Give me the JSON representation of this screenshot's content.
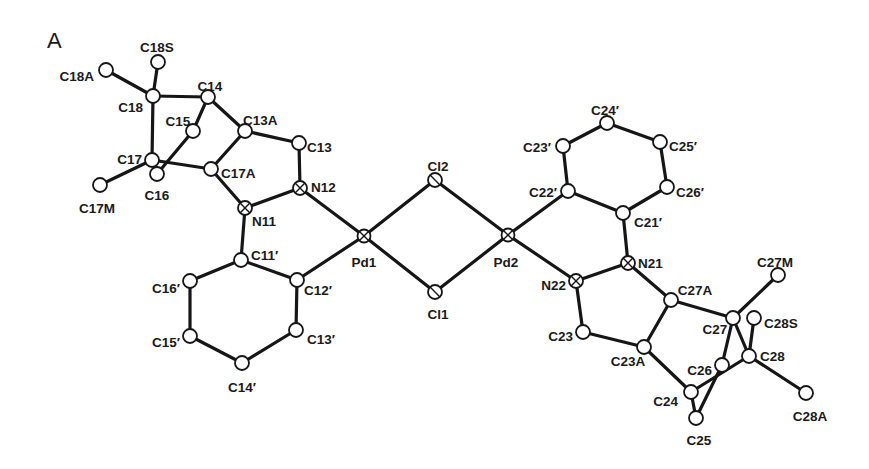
{
  "figure": {
    "panel_label": "A",
    "type": "ORTEP molecular structure drawing",
    "background": "#ffffff",
    "ink_color": "#161616"
  },
  "atoms": [
    {
      "id": "C18S",
      "x": 158,
      "y": 62,
      "label": "C18S",
      "lx": 157,
      "ly": 48,
      "anchor": "middle",
      "kind": "C"
    },
    {
      "id": "C18A",
      "x": 106,
      "y": 70,
      "label": "C18A",
      "lx": 94,
      "ly": 77,
      "anchor": "end",
      "kind": "C"
    },
    {
      "id": "C18",
      "x": 153,
      "y": 96,
      "label": "C18",
      "lx": 143,
      "ly": 108,
      "anchor": "end",
      "kind": "C"
    },
    {
      "id": "C14",
      "x": 208,
      "y": 97,
      "label": "C14",
      "lx": 210,
      "ly": 87,
      "anchor": "middle",
      "kind": "C"
    },
    {
      "id": "C15",
      "x": 193,
      "y": 131,
      "label": "C15",
      "lx": 178,
      "ly": 122,
      "anchor": "middle",
      "kind": "C"
    },
    {
      "id": "C13A",
      "x": 245,
      "y": 131,
      "label": "C13A",
      "lx": 243,
      "ly": 121,
      "anchor": "start",
      "kind": "C"
    },
    {
      "id": "C17",
      "x": 152,
      "y": 160,
      "label": "C17",
      "lx": 142,
      "ly": 160,
      "anchor": "end",
      "kind": "C"
    },
    {
      "id": "C16",
      "x": 157,
      "y": 174,
      "label": "C16",
      "lx": 157,
      "ly": 196,
      "anchor": "middle",
      "kind": "C"
    },
    {
      "id": "C17A",
      "x": 211,
      "y": 169,
      "label": "C17A",
      "lx": 221,
      "ly": 174,
      "anchor": "start",
      "kind": "C"
    },
    {
      "id": "C17M",
      "x": 100,
      "y": 185,
      "label": "C17M",
      "lx": 97,
      "ly": 209,
      "anchor": "middle",
      "kind": "C"
    },
    {
      "id": "C13",
      "x": 299,
      "y": 143,
      "label": "C13",
      "lx": 307,
      "ly": 148,
      "anchor": "start",
      "kind": "C"
    },
    {
      "id": "N12",
      "x": 300,
      "y": 188,
      "label": "N12",
      "lx": 311,
      "ly": 188,
      "anchor": "start",
      "kind": "N"
    },
    {
      "id": "N11",
      "x": 245,
      "y": 208,
      "label": "N11",
      "lx": 252,
      "ly": 222,
      "anchor": "start",
      "kind": "N"
    },
    {
      "id": "C11p",
      "x": 241,
      "y": 260,
      "label": "C11′",
      "lx": 251,
      "ly": 256,
      "anchor": "start",
      "kind": "C"
    },
    {
      "id": "C12p",
      "x": 297,
      "y": 280,
      "label": "C12′",
      "lx": 304,
      "ly": 291,
      "anchor": "start",
      "kind": "C"
    },
    {
      "id": "C13p",
      "x": 296,
      "y": 330,
      "label": "C13′",
      "lx": 307,
      "ly": 340,
      "anchor": "start",
      "kind": "C"
    },
    {
      "id": "C14p",
      "x": 242,
      "y": 363,
      "label": "C14′",
      "lx": 242,
      "ly": 388,
      "anchor": "middle",
      "kind": "C"
    },
    {
      "id": "C15p",
      "x": 190,
      "y": 336,
      "label": "C15′",
      "lx": 180,
      "ly": 343,
      "anchor": "end",
      "kind": "C"
    },
    {
      "id": "C16p",
      "x": 190,
      "y": 281,
      "label": "C16′",
      "lx": 180,
      "ly": 289,
      "anchor": "end",
      "kind": "C"
    },
    {
      "id": "Pd1",
      "x": 364,
      "y": 236,
      "label": "Pd1",
      "lx": 364,
      "ly": 263,
      "anchor": "middle",
      "kind": "Pd"
    },
    {
      "id": "Cl2",
      "x": 435,
      "y": 180,
      "label": "Cl2",
      "lx": 438,
      "ly": 167,
      "anchor": "middle",
      "kind": "Cl"
    },
    {
      "id": "Cl1",
      "x": 435,
      "y": 292,
      "label": "Cl1",
      "lx": 438,
      "ly": 315,
      "anchor": "middle",
      "kind": "Cl"
    },
    {
      "id": "Pd2",
      "x": 508,
      "y": 235,
      "label": "Pd2",
      "lx": 506,
      "ly": 263,
      "anchor": "middle",
      "kind": "Pd"
    },
    {
      "id": "C22p",
      "x": 568,
      "y": 191,
      "label": "C22′",
      "lx": 557,
      "ly": 193,
      "anchor": "end",
      "kind": "C"
    },
    {
      "id": "C23p",
      "x": 563,
      "y": 146,
      "label": "C23′",
      "lx": 551,
      "ly": 148,
      "anchor": "end",
      "kind": "C"
    },
    {
      "id": "C24p",
      "x": 607,
      "y": 123,
      "label": "C24′",
      "lx": 605,
      "ly": 111,
      "anchor": "middle",
      "kind": "C"
    },
    {
      "id": "C25p",
      "x": 660,
      "y": 142,
      "label": "C25′",
      "lx": 669,
      "ly": 147,
      "anchor": "start",
      "kind": "C"
    },
    {
      "id": "C26p",
      "x": 667,
      "y": 187,
      "label": "C26′",
      "lx": 676,
      "ly": 193,
      "anchor": "start",
      "kind": "C"
    },
    {
      "id": "C21p",
      "x": 623,
      "y": 213,
      "label": "C21′",
      "lx": 634,
      "ly": 223,
      "anchor": "start",
      "kind": "C"
    },
    {
      "id": "N21",
      "x": 628,
      "y": 263,
      "label": "N21",
      "lx": 638,
      "ly": 264,
      "anchor": "start",
      "kind": "N"
    },
    {
      "id": "N22",
      "x": 576,
      "y": 281,
      "label": "N22",
      "lx": 566,
      "ly": 286,
      "anchor": "end",
      "kind": "N"
    },
    {
      "id": "C23",
      "x": 583,
      "y": 332,
      "label": "C23",
      "lx": 573,
      "ly": 337,
      "anchor": "end",
      "kind": "C"
    },
    {
      "id": "C23A",
      "x": 644,
      "y": 347,
      "label": "C23A",
      "lx": 628,
      "ly": 362,
      "anchor": "middle",
      "kind": "C"
    },
    {
      "id": "C27A",
      "x": 671,
      "y": 300,
      "label": "C27A",
      "lx": 695,
      "ly": 291,
      "anchor": "middle",
      "kind": "C"
    },
    {
      "id": "C27",
      "x": 733,
      "y": 318,
      "label": "C27",
      "lx": 715,
      "ly": 330,
      "anchor": "middle",
      "kind": "C"
    },
    {
      "id": "C27M",
      "x": 778,
      "y": 275,
      "label": "C27M",
      "lx": 775,
      "ly": 263,
      "anchor": "middle",
      "kind": "C"
    },
    {
      "id": "C28S",
      "x": 754,
      "y": 318,
      "label": "C28S",
      "lx": 764,
      "ly": 324,
      "anchor": "start",
      "kind": "C"
    },
    {
      "id": "C28",
      "x": 749,
      "y": 356,
      "label": "C28",
      "lx": 760,
      "ly": 357,
      "anchor": "start",
      "kind": "C"
    },
    {
      "id": "C26",
      "x": 722,
      "y": 365,
      "label": "C26",
      "lx": 712,
      "ly": 371,
      "anchor": "end",
      "kind": "C"
    },
    {
      "id": "C24",
      "x": 691,
      "y": 392,
      "label": "C24",
      "lx": 678,
      "ly": 402,
      "anchor": "end",
      "kind": "C"
    },
    {
      "id": "C25",
      "x": 696,
      "y": 418,
      "label": "C25",
      "lx": 699,
      "ly": 441,
      "anchor": "middle",
      "kind": "C"
    },
    {
      "id": "C28A",
      "x": 806,
      "y": 393,
      "label": "C28A",
      "lx": 810,
      "ly": 417,
      "anchor": "middle",
      "kind": "C"
    }
  ],
  "bonds": [
    [
      "C18A",
      "C18"
    ],
    [
      "C18S",
      "C18"
    ],
    [
      "C18",
      "C14"
    ],
    [
      "C18",
      "C17"
    ],
    [
      "C14",
      "C15"
    ],
    [
      "C14",
      "C13A"
    ],
    [
      "C15",
      "C16"
    ],
    [
      "C17",
      "C16"
    ],
    [
      "C17",
      "C17M"
    ],
    [
      "C17",
      "C17A"
    ],
    [
      "C13A",
      "C17A"
    ],
    [
      "C13A",
      "C13"
    ],
    [
      "C13",
      "N12"
    ],
    [
      "N12",
      "N11"
    ],
    [
      "C17A",
      "N11"
    ],
    [
      "N11",
      "C11p"
    ],
    [
      "N12",
      "Pd1"
    ],
    [
      "C11p",
      "C12p"
    ],
    [
      "C12p",
      "C13p"
    ],
    [
      "C13p",
      "C14p"
    ],
    [
      "C14p",
      "C15p"
    ],
    [
      "C15p",
      "C16p"
    ],
    [
      "C16p",
      "C11p"
    ],
    [
      "C12p",
      "Pd1"
    ],
    [
      "Pd1",
      "Cl2"
    ],
    [
      "Pd1",
      "Cl1"
    ],
    [
      "Cl2",
      "Pd2"
    ],
    [
      "Cl1",
      "Pd2"
    ],
    [
      "Pd2",
      "C22p"
    ],
    [
      "Pd2",
      "N22"
    ],
    [
      "C22p",
      "C23p"
    ],
    [
      "C23p",
      "C24p"
    ],
    [
      "C24p",
      "C25p"
    ],
    [
      "C25p",
      "C26p"
    ],
    [
      "C26p",
      "C21p"
    ],
    [
      "C21p",
      "C22p"
    ],
    [
      "C21p",
      "N21"
    ],
    [
      "N21",
      "N22"
    ],
    [
      "N22",
      "C23"
    ],
    [
      "C23",
      "C23A"
    ],
    [
      "N21",
      "C27A"
    ],
    [
      "C27A",
      "C23A"
    ],
    [
      "C27A",
      "C27"
    ],
    [
      "C27",
      "C27M"
    ],
    [
      "C27",
      "C28"
    ],
    [
      "C27",
      "C26"
    ],
    [
      "C28",
      "C28S"
    ],
    [
      "C28",
      "C28A"
    ],
    [
      "C28",
      "C24"
    ],
    [
      "C23A",
      "C24"
    ],
    [
      "C24",
      "C25"
    ],
    [
      "C25",
      "C26"
    ]
  ]
}
